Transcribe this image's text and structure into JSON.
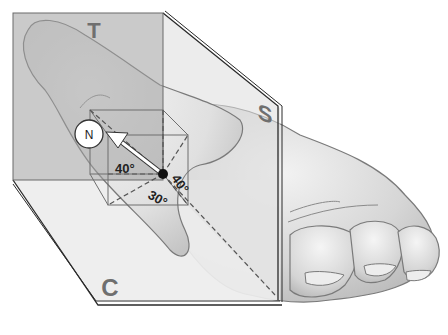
{
  "figure": {
    "planes": {
      "transverse_label": "T",
      "sagittal_label": "S",
      "coronal_label": "C"
    },
    "direction_marker": {
      "label": "N"
    },
    "angles": {
      "in_coronal_plane": "40°",
      "in_sagittal_plane": "40°",
      "in_transverse_plane": "30°"
    }
  },
  "colors": {
    "background": "#ffffff",
    "plane_dark": "#a9a9a9",
    "plane_light": "#ececec",
    "plane_label": "#6f6f6f",
    "hand_fill": "#dcdcdc",
    "hand_outline": "#7a7a7a",
    "edge": "#2a2a2a",
    "arrow": "#ffffff"
  }
}
